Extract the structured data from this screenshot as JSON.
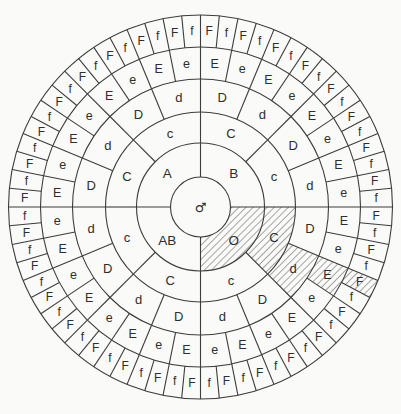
{
  "wheel": {
    "center_symbol": "♂",
    "description_names": {
      "ring1": "abo-blood-type-ring",
      "ring2": "c-antigen-ring",
      "ring3": "d-antigen-ring",
      "ring4": "e-antigen-ring",
      "ring5": "f-antigen-ring"
    },
    "rings": [
      {
        "name": "abo-blood-type-ring",
        "cells": [
          "B",
          "O",
          "AB",
          "A"
        ],
        "hatched_indices": [
          1
        ]
      },
      {
        "name": "c-antigen-ring",
        "cells": [
          "C",
          "c",
          "C",
          "c",
          "C",
          "c",
          "C",
          "c"
        ],
        "hatched_indices": [
          2
        ]
      },
      {
        "name": "d-antigen-ring",
        "cells": [
          "D",
          "d",
          "D",
          "d",
          "D",
          "d",
          "D",
          "d",
          "D",
          "d",
          "D",
          "d",
          "D",
          "d",
          "D",
          "d"
        ],
        "hatched_indices": [
          5
        ]
      },
      {
        "name": "e-antigen-ring",
        "cells": [
          "E",
          "e",
          "E",
          "e",
          "E",
          "e",
          "E",
          "e",
          "E",
          "e",
          "E",
          "e",
          "E",
          "e",
          "E",
          "e",
          "E",
          "e",
          "E",
          "e",
          "E",
          "e",
          "E",
          "e",
          "E",
          "e",
          "E",
          "e",
          "E",
          "e",
          "E",
          "e"
        ],
        "hatched_indices": [
          10
        ]
      },
      {
        "name": "f-antigen-ring",
        "cells": [
          "F",
          "f",
          "F",
          "f",
          "F",
          "f",
          "F",
          "f",
          "F",
          "f",
          "F",
          "f",
          "F",
          "f",
          "F",
          "f",
          "F",
          "f",
          "F",
          "f",
          "F",
          "f",
          "F",
          "f",
          "F",
          "f",
          "F",
          "f",
          "F",
          "f",
          "F",
          "f",
          "F",
          "f",
          "F",
          "f",
          "F",
          "f",
          "F",
          "f",
          "F",
          "f",
          "F",
          "f",
          "F",
          "f",
          "F",
          "f",
          "F",
          "f",
          "F",
          "f",
          "F",
          "f",
          "F",
          "f",
          "F",
          "f",
          "F",
          "f",
          "F",
          "f",
          "F",
          "f"
        ],
        "hatched_indices": [
          20
        ]
      }
    ],
    "hatched_path_labels": [
      "O",
      "C",
      "d",
      "E",
      "F"
    ],
    "colors": {
      "line": "#3d3d3d",
      "text": "#2e2e2e",
      "background": "#fafaf8",
      "hatch_line": "#4e4e4e"
    }
  }
}
